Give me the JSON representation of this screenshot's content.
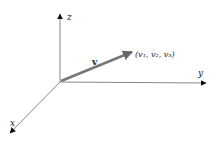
{
  "diagram": {
    "axes": {
      "x": {
        "label": "x"
      },
      "y": {
        "label": "y"
      },
      "z": {
        "label": "z"
      }
    },
    "vector": {
      "label": "v",
      "endpoint_label": "(v₁, v₂, v₃)"
    },
    "colors": {
      "axis": "#888888",
      "arrowhead": "#111111",
      "vector": "#777777"
    }
  }
}
